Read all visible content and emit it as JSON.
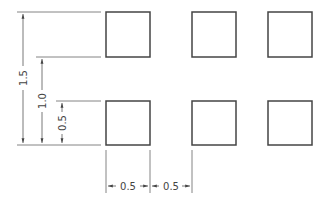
{
  "colors": {
    "background": "#ffffff",
    "square_stroke": "#444444",
    "dimension_stroke": "#555555"
  },
  "grid": {
    "rows": 2,
    "columns": 3,
    "squares": [
      {
        "row": 1,
        "col": 1
      },
      {
        "row": 1,
        "col": 2
      },
      {
        "row": 1,
        "col": 3
      },
      {
        "row": 2,
        "col": 1
      },
      {
        "row": 2,
        "col": 2
      },
      {
        "row": 2,
        "col": 3
      }
    ]
  },
  "dimensions": {
    "vertical": [
      {
        "label": "1.5",
        "spans": "bottom of lower row to top of upper row"
      },
      {
        "label": "1.0",
        "spans": "bottom of lower row to bottom of upper row"
      },
      {
        "label": "0.5",
        "spans": "bottom of lower row to top of lower row"
      }
    ],
    "horizontal": [
      {
        "label": "0.5",
        "spans": "width of first column square"
      },
      {
        "label": "0.5",
        "spans": "gap between first and second column"
      }
    ]
  }
}
